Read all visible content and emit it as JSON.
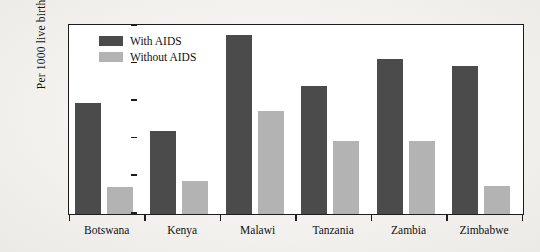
{
  "chart_data": {
    "type": "bar",
    "title": "",
    "subtitle": "",
    "xlabel": "",
    "ylabel": "Per 1000 live births",
    "ylim": [
      0,
      250
    ],
    "yticks": [
      0,
      50,
      100,
      150,
      200,
      250
    ],
    "grid": false,
    "legend_position": "top-left",
    "categories": [
      "Botswana",
      "Kenya",
      "Malawi",
      "Tanzania",
      "Zambia",
      "Zimbabwe"
    ],
    "series": [
      {
        "name": "With AIDS",
        "color": "#4b4b4b",
        "values": [
          148,
          111,
          238,
          170,
          206,
          197
        ]
      },
      {
        "name": "Without AIDS",
        "color": "#b3b3b3",
        "values": [
          36,
          44,
          137,
          97,
          97,
          37
        ]
      }
    ]
  },
  "legend": {
    "items": [
      {
        "label": "With AIDS"
      },
      {
        "label": "Without AIDS"
      }
    ]
  },
  "axis": {
    "y_title": "Per 1000 live births"
  }
}
